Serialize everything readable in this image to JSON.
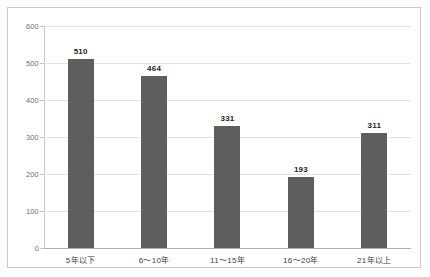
{
  "chart_data": {
    "type": "bar",
    "title": "",
    "subtitle": "",
    "xlabel": "",
    "ylabel": "",
    "categories": [
      "5年以下",
      "6～10年",
      "11～15年",
      "16～20年",
      "21年以上"
    ],
    "values": [
      510,
      464,
      331,
      193,
      311
    ],
    "series": [
      {
        "name": "",
        "values": [
          510,
          464,
          331,
          193,
          311
        ]
      }
    ],
    "value_labels": [
      "510",
      "464",
      "331",
      "193",
      "311"
    ],
    "ylim": [
      0,
      600
    ],
    "ytick_labels": [
      "600",
      "500",
      "400",
      "300",
      "200",
      "100",
      "0"
    ],
    "ytick_values": [
      600,
      500,
      400,
      300,
      200,
      100,
      0
    ],
    "grid": true,
    "grid_axis": "y",
    "legend": false,
    "legend_position": "none",
    "bar_color": "#5e5e5e",
    "grid_color": "#e3e3e3",
    "axis_color": "#c4c4c4",
    "frame_color": "#c9c9c9",
    "label_color": "#262626",
    "tick_label_color": "#6f6f6f",
    "background": "#ffffff"
  }
}
